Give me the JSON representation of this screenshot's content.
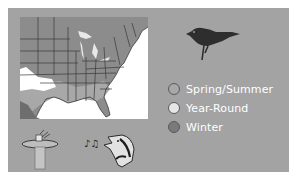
{
  "card": {
    "background": "#a3a3a3"
  },
  "map": {
    "region": "Eastern United States",
    "land_color": "#8c8c8c",
    "water_color": "#ffffff",
    "border_color": "#3a3a3a",
    "range_colors": {
      "spring_summer": "#a8a8a8",
      "year_round": "#d8d8d8",
      "winter": "#707070"
    }
  },
  "bird_icon": "bird-silhouette-icon",
  "legend": {
    "items": [
      {
        "label": "Spring/Summer",
        "color": "#a8a8a8"
      },
      {
        "label": "Year-Round",
        "color": "#e6e6e6"
      },
      {
        "label": "Winter",
        "color": "#7a7a7a"
      }
    ]
  },
  "bottom_icons": [
    {
      "name": "bird-bath-icon"
    },
    {
      "name": "singing-bird-icon"
    }
  ]
}
